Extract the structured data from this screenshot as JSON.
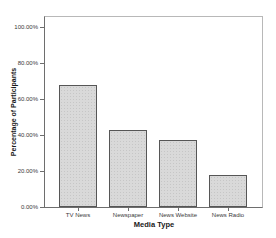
{
  "chart_data": {
    "type": "bar",
    "title": "",
    "categories": [
      "TV News",
      "Newspaper",
      "News Website",
      "News Radio"
    ],
    "values": [
      68,
      43,
      37,
      18
    ],
    "xlabel": "Media Type",
    "ylabel": "Percentage of Participants",
    "ylim": [
      0,
      100
    ],
    "yticks": [
      0,
      20,
      40,
      60,
      80,
      100
    ],
    "ytick_labels": [
      "0.00%",
      "20.00%",
      "40.00%",
      "60.00%",
      "80.00%",
      "100.00%"
    ],
    "grid": false,
    "legend": null,
    "colors": {
      "bar_fill": "#d9d9d9",
      "bar_pattern_dot": "#c6c6c6",
      "bar_border": "#565656",
      "axis_line": "#6e6e6e",
      "frame_line": "#b8b8b8",
      "text": "#1a1a1a",
      "background": "#ffffff"
    }
  }
}
